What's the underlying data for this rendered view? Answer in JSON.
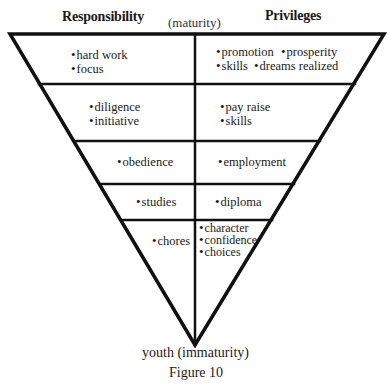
{
  "headers": {
    "left": "Responsibility",
    "center": "(maturity)",
    "right": "Privileges"
  },
  "rows": [
    {
      "responsibility": [
        "hard work",
        "focus"
      ],
      "privileges": [
        "promotion",
        "prosperity",
        "skills",
        "dreams realized"
      ]
    },
    {
      "responsibility": [
        "diligence",
        "initiative"
      ],
      "privileges": [
        "pay raise",
        "skills"
      ]
    },
    {
      "responsibility": [
        "obedience"
      ],
      "privileges": [
        "employment"
      ]
    },
    {
      "responsibility": [
        "studies"
      ],
      "privileges": [
        "diploma"
      ]
    },
    {
      "responsibility": [
        "chores"
      ],
      "privileges": [
        "character",
        "confidence",
        "choices"
      ]
    }
  ],
  "bottom_label": "youth (immaturity)",
  "caption": "Figure 10"
}
